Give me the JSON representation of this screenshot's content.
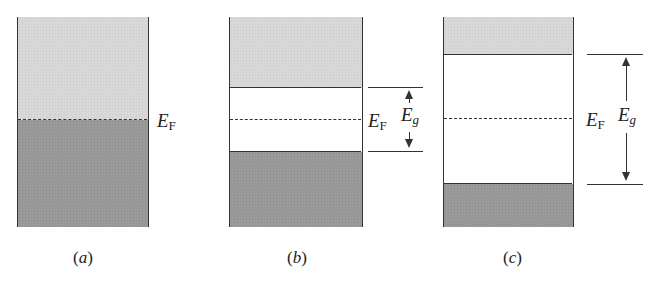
{
  "figure": {
    "panels": [
      {
        "id": "a",
        "caption_open": "(",
        "caption_letter": "a",
        "caption_close": ")",
        "fermi_label": "E",
        "fermi_sub": "F",
        "description": "Metal: partially filled band, Fermi level within band"
      },
      {
        "id": "b",
        "caption_open": "(",
        "caption_letter": "b",
        "caption_close": ")",
        "fermi_label": "E",
        "fermi_sub": "F",
        "gap_label": "E",
        "gap_sub": "g",
        "description": "Semiconductor: small band gap, Fermi level mid-gap"
      },
      {
        "id": "c",
        "caption_open": "(",
        "caption_letter": "c",
        "caption_close": ")",
        "fermi_label": "E",
        "fermi_sub": "F",
        "gap_label": "E",
        "gap_sub": "g",
        "description": "Insulator: large band gap, Fermi level mid-gap"
      }
    ],
    "colors": {
      "empty_band": "#d8d8d8",
      "filled_band": "#9a9a9a",
      "gap": "#ffffff",
      "lines": "#333333"
    }
  }
}
